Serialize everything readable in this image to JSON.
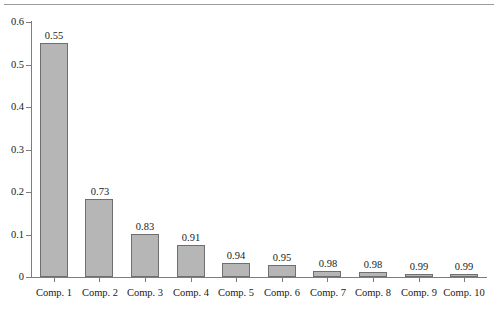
{
  "chart_data": {
    "type": "bar",
    "title": "",
    "subtitle": "",
    "xlabel": "",
    "ylabel": "",
    "grid": false,
    "legend": "none",
    "categories": [
      "Comp. 1",
      "Comp. 2",
      "Comp. 3",
      "Comp. 4",
      "Comp. 5",
      "Comp. 6",
      "Comp. 7",
      "Comp. 8",
      "Comp. 9",
      "Comp. 10"
    ],
    "values": [
      0.551,
      0.183,
      0.102,
      0.075,
      0.033,
      0.029,
      0.013,
      0.012,
      0.007,
      0.006
    ],
    "bar_labels": [
      "0.55",
      "0.73",
      "0.83",
      "0.91",
      "0.94",
      "0.95",
      "0.98",
      "0.98",
      "0.99",
      "0.99"
    ],
    "ylim": [
      0,
      0.6
    ],
    "yticks": [
      0,
      0.1,
      0.2,
      0.3,
      0.4,
      0.5,
      0.6
    ],
    "ytick_labels": [
      "0",
      "0.1",
      "0.2",
      "0.3",
      "0.4",
      "0.5",
      "0.6"
    ],
    "xtick_labels": [
      "Comp. 1",
      "Comp. 2",
      "Comp. 3",
      "Comp. 4",
      "Comp. 5",
      "Comp. 6",
      "Comp. 7",
      "Comp. 8",
      "Comp. 9",
      "Comp. 10"
    ],
    "colors": {
      "bar_fill": "#b6b6b6",
      "bar_border": "#6f6f6f",
      "axis": "#7d7d7d",
      "text": "#1a1a1a",
      "background": "#ffffff",
      "rule": "#9a9a9a"
    }
  }
}
